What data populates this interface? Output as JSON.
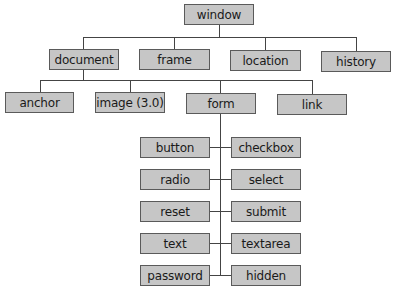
{
  "diagram": {
    "type": "object-hierarchy-tree",
    "root": "window",
    "nodes": [
      {
        "id": "window",
        "label": "window",
        "x": 184,
        "y": 4,
        "w": 70,
        "parent": null
      },
      {
        "id": "document",
        "label": "document",
        "x": 49,
        "y": 49,
        "w": 70,
        "parent": "window"
      },
      {
        "id": "frame",
        "label": "frame",
        "x": 139,
        "y": 49,
        "w": 71,
        "parent": "window"
      },
      {
        "id": "location",
        "label": "location",
        "x": 230,
        "y": 50,
        "w": 71,
        "parent": "window"
      },
      {
        "id": "history",
        "label": "history",
        "x": 321,
        "y": 51,
        "w": 70,
        "parent": "window"
      },
      {
        "id": "anchor",
        "label": "anchor",
        "x": 5,
        "y": 92,
        "w": 69,
        "parent": "document"
      },
      {
        "id": "image",
        "label": "image (3.0)",
        "x": 95,
        "y": 92,
        "w": 70,
        "parent": "document"
      },
      {
        "id": "form",
        "label": "form",
        "x": 186,
        "y": 93,
        "w": 70,
        "parent": "document"
      },
      {
        "id": "link",
        "label": "link",
        "x": 277,
        "y": 94,
        "w": 70,
        "parent": "document"
      },
      {
        "id": "button",
        "label": "button",
        "x": 140,
        "y": 137,
        "w": 70,
        "parent": "form"
      },
      {
        "id": "checkbox",
        "label": "checkbox",
        "x": 231,
        "y": 137,
        "w": 70,
        "parent": "form"
      },
      {
        "id": "radio",
        "label": "radio",
        "x": 140,
        "y": 169,
        "w": 70,
        "parent": "form"
      },
      {
        "id": "select",
        "label": "select",
        "x": 231,
        "y": 169,
        "w": 70,
        "parent": "form"
      },
      {
        "id": "reset",
        "label": "reset",
        "x": 140,
        "y": 201,
        "w": 70,
        "parent": "form"
      },
      {
        "id": "submit",
        "label": "submit",
        "x": 231,
        "y": 201,
        "w": 70,
        "parent": "form"
      },
      {
        "id": "text",
        "label": "text",
        "x": 140,
        "y": 233,
        "w": 70,
        "parent": "form"
      },
      {
        "id": "textarea",
        "label": "textarea",
        "x": 231,
        "y": 233,
        "w": 70,
        "parent": "form"
      },
      {
        "id": "password",
        "label": "password",
        "x": 140,
        "y": 265,
        "w": 70,
        "parent": "form"
      },
      {
        "id": "hidden",
        "label": "hidden",
        "x": 231,
        "y": 265,
        "w": 70,
        "parent": "form"
      }
    ]
  },
  "colors": {
    "node_fill": "#c6c6c6",
    "node_border": "#5a5a5a",
    "connector": "#444444",
    "background": "#ffffff"
  }
}
